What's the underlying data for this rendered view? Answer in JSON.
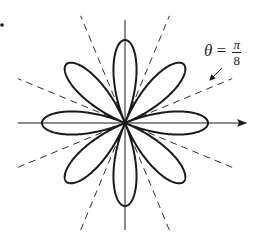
{
  "figure": {
    "curve": {
      "type": "polar-rose",
      "petals": 8,
      "k": 4,
      "function": "cos"
    },
    "center": [
      125,
      123
    ],
    "petal_radius_px": 83,
    "axes": {
      "x": {
        "from": 18,
        "to": 246,
        "arrow": true
      },
      "y": {
        "from": 20,
        "to": 230,
        "arrow": false
      }
    },
    "dashed_lines": {
      "angles_deg": [
        22.5,
        67.5,
        112.5,
        157.5
      ],
      "half_length_px": 116
    },
    "annotation": {
      "theta_symbol": "θ",
      "equals": "=",
      "numerator": "π",
      "denominator": "8",
      "arrow_from": [
        222,
        68
      ],
      "arrow_to": [
        210,
        80
      ]
    },
    "marker_dot": [
      2,
      25
    ],
    "colors": {
      "stroke": "#1a1a1a",
      "dash": "#333333",
      "background": "#ffffff"
    }
  },
  "chart_data": {
    "type": "line",
    "series": [
      {
        "name": "rose curve",
        "equation": "r = cos 4θ",
        "petals": 8
      }
    ],
    "annotations": [
      "θ = π/8"
    ],
    "reference_lines_deg": [
      22.5,
      67.5,
      112.5,
      157.5
    ]
  }
}
